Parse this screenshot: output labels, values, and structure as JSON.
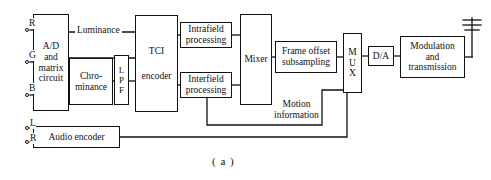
{
  "figure": {
    "caption": "( a )",
    "line_color": "#111111",
    "background": "#ffffff"
  },
  "inputs": {
    "video_terminals": [
      {
        "label": "R",
        "x": 26,
        "y": 30
      },
      {
        "label": "G",
        "x": 26,
        "y": 62
      },
      {
        "label": "B",
        "x": 26,
        "y": 95
      }
    ],
    "audio_terminals": [
      {
        "label": "L",
        "x": 26,
        "y": 128
      },
      {
        "label": "R",
        "x": 26,
        "y": 142
      }
    ]
  },
  "blocks": [
    {
      "name": "ad-matrix-circuit",
      "lines": [
        "A/D",
        "and",
        "matrix",
        "circuit"
      ],
      "x": 33,
      "y": 14,
      "w": 36,
      "h": 97,
      "orientation": "stacked"
    },
    {
      "name": "chrominance",
      "lines": [
        "Chro-",
        "minance"
      ],
      "x": 69,
      "y": 58,
      "w": 44,
      "h": 47,
      "orientation": "stacked"
    },
    {
      "name": "low-pass-filter",
      "lines": [
        "L",
        "P",
        "F"
      ],
      "x": 114,
      "y": 55,
      "w": 15,
      "h": 50,
      "orientation": "stacked"
    },
    {
      "name": "tci-encoder",
      "lines": [
        "TCI",
        "encoder"
      ],
      "x": 135,
      "y": 15,
      "w": 43,
      "h": 97,
      "orientation": "stacked"
    },
    {
      "name": "intrafield-processing",
      "lines": [
        "Intrafield",
        "processing"
      ],
      "x": 180,
      "y": 22,
      "w": 52,
      "h": 26,
      "orientation": "stacked"
    },
    {
      "name": "interfield-processing",
      "lines": [
        "Interfield",
        "processing"
      ],
      "x": 180,
      "y": 72,
      "w": 52,
      "h": 26,
      "orientation": "stacked"
    },
    {
      "name": "mixer",
      "lines": [
        "Mixer"
      ],
      "x": 240,
      "y": 14,
      "w": 32,
      "h": 91,
      "orientation": "stacked"
    },
    {
      "name": "frame-offset-subsampling",
      "lines": [
        "Frame offset",
        "subsampling"
      ],
      "x": 275,
      "y": 41,
      "w": 62,
      "h": 32,
      "orientation": "stacked"
    },
    {
      "name": "mux",
      "lines": [
        "M",
        "U",
        "X"
      ],
      "x": 343,
      "y": 33,
      "w": 19,
      "h": 60,
      "orientation": "stacked"
    },
    {
      "name": "digital-to-analog",
      "lines": [
        "D/A"
      ],
      "x": 368,
      "y": 46,
      "w": 26,
      "h": 20,
      "orientation": "stacked"
    },
    {
      "name": "modulation-and-transmission",
      "lines": [
        "Modulation",
        "and",
        "transmission"
      ],
      "x": 400,
      "y": 36,
      "w": 65,
      "h": 42,
      "orientation": "stacked"
    },
    {
      "name": "audio-encoder",
      "lines": [
        "Audio encoder"
      ],
      "x": 33,
      "y": 126,
      "w": 87,
      "h": 22,
      "orientation": "stacked"
    }
  ],
  "signal_labels": [
    {
      "name": "luminance-label",
      "text": "Luminance",
      "x": 75,
      "y": 18
    },
    {
      "name": "motion-information-label",
      "lines": [
        "Motion",
        "information"
      ],
      "x": 270,
      "y": 105
    }
  ],
  "antenna": {
    "name": "antenna-icon",
    "mast_x": 472,
    "mast_top": 18,
    "mast_bottom": 57,
    "bars": [
      {
        "y": 20,
        "half_width": 9
      },
      {
        "y": 25,
        "half_width": 9
      },
      {
        "y": 30,
        "half_width": 7
      }
    ]
  },
  "wires": {
    "description": "Block diagram interconnect polylines",
    "paths": [
      {
        "name": "wire-r-input",
        "d": "M30 30 L33 30"
      },
      {
        "name": "wire-g-input",
        "d": "M30 62 L33 62"
      },
      {
        "name": "wire-b-input",
        "d": "M30 95 L33 95"
      },
      {
        "name": "wire-luminance-to-tci",
        "d": "M69 32 L135 32"
      },
      {
        "name": "wire-ad-to-chrominance",
        "d": "M69 81 L69 81"
      },
      {
        "name": "wire-chrominance-to-lpf",
        "d": "M113 81 L114 81"
      },
      {
        "name": "wire-lpf-to-tci",
        "d": "M129 81 L135 81"
      },
      {
        "name": "wire-tci-to-intrafield",
        "d": "M178 35 L180 35"
      },
      {
        "name": "wire-tci-to-interfield",
        "d": "M178 85 L180 85"
      },
      {
        "name": "wire-intrafield-to-mixer",
        "d": "M232 35 L240 35"
      },
      {
        "name": "wire-interfield-to-mixer",
        "d": "M232 85 L240 85"
      },
      {
        "name": "wire-mixer-to-frameoffset",
        "d": "M272 57 L275 57"
      },
      {
        "name": "wire-frameoffset-to-mux",
        "d": "M337 57 L343 57"
      },
      {
        "name": "wire-mux-to-da",
        "d": "M362 56 L368 56"
      },
      {
        "name": "wire-da-to-modulation",
        "d": "M394 56 L400 56"
      },
      {
        "name": "wire-modulation-to-antenna",
        "d": "M465 57 L472 57"
      },
      {
        "name": "wire-motion-information",
        "d": "M207 98 L207 125 L322 125 L322 90 L343 90"
      },
      {
        "name": "wire-audio-to-mux",
        "d": "M120 137 L347 137 L347 93"
      },
      {
        "name": "wire-l-input",
        "d": "M30 128 L33 128"
      },
      {
        "name": "wire-r-audio-input",
        "d": "M30 142 L33 142"
      }
    ]
  }
}
